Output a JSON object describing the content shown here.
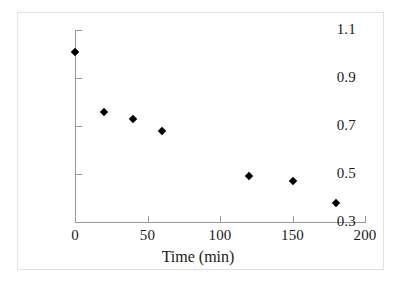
{
  "chart_data": {
    "type": "scatter",
    "title": "",
    "xlabel": "Time (min)",
    "ylabel": "[TNT] / [TNT]0",
    "ylabel_base": "[TNT] / [TNT]",
    "ylabel_sub": "0",
    "xlim": [
      0,
      200
    ],
    "ylim": [
      0.3,
      1.1
    ],
    "grid": false,
    "legend": "none",
    "marker": "filled-diamond",
    "marker_color": "#000000",
    "x_ticks": [
      0,
      50,
      100,
      150,
      200
    ],
    "x_tick_labels": [
      "0",
      "50",
      "100",
      "150",
      "200"
    ],
    "y_ticks": [
      0.3,
      0.5,
      0.7,
      0.9,
      1.1
    ],
    "y_tick_labels": [
      "0.3",
      "0.5",
      "0.7",
      "0.9",
      "1.1"
    ],
    "x": [
      0,
      20,
      40,
      60,
      120,
      150,
      180
    ],
    "values": [
      1.01,
      0.76,
      0.73,
      0.68,
      0.49,
      0.47,
      0.38
    ],
    "points": [
      {
        "x": 0,
        "y": 1.01
      },
      {
        "x": 20,
        "y": 0.76
      },
      {
        "x": 40,
        "y": 0.73
      },
      {
        "x": 60,
        "y": 0.68
      },
      {
        "x": 120,
        "y": 0.49
      },
      {
        "x": 150,
        "y": 0.47
      },
      {
        "x": 180,
        "y": 0.38
      }
    ]
  }
}
